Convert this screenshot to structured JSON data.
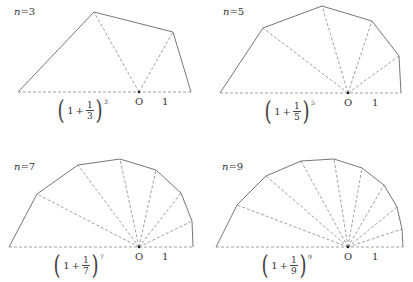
{
  "colors": {
    "line": "#666666",
    "dash": "#888888",
    "text": "#333333"
  },
  "panels": [
    {
      "n": "3",
      "n_prefix": "n",
      "equals": "=",
      "label_pos": [
        14,
        6
      ],
      "origin": [
        139,
        92
      ],
      "left_end": [
        18,
        92
      ],
      "right_end": [
        191,
        92
      ],
      "vertices": [
        [
          18,
          92
        ],
        [
          94,
          12
        ],
        [
          173,
          32
        ],
        [
          191,
          92
        ]
      ],
      "spokes": [
        [
          94,
          12
        ],
        [
          173,
          32
        ]
      ],
      "o_label": "O",
      "o_label_pos": [
        135,
        96
      ],
      "one_label": "1",
      "one_label_pos": [
        162,
        96
      ],
      "formula": {
        "one": "1",
        "plus": "+",
        "num": "1",
        "den": "3",
        "exp": "3"
      },
      "formula_pos": [
        56,
        96
      ]
    },
    {
      "n": "5",
      "n_prefix": "n",
      "equals": "=",
      "label_pos": [
        223,
        6
      ],
      "origin": [
        348,
        93
      ],
      "left_end": [
        220,
        93
      ],
      "right_end": [
        401,
        93
      ],
      "vertices": [
        [
          220,
          93
        ],
        [
          263,
          28
        ],
        [
          322,
          6
        ],
        [
          372,
          21
        ],
        [
          399,
          56
        ],
        [
          401,
          93
        ]
      ],
      "spokes": [
        [
          263,
          28
        ],
        [
          322,
          6
        ],
        [
          372,
          21
        ],
        [
          399,
          56
        ]
      ],
      "o_label": "O",
      "o_label_pos": [
        344,
        97
      ],
      "one_label": "1",
      "one_label_pos": [
        372,
        97
      ],
      "formula": {
        "one": "1",
        "plus": "+",
        "num": "1",
        "den": "5",
        "exp": "5"
      },
      "formula_pos": [
        263,
        97
      ]
    },
    {
      "n": "7",
      "n_prefix": "n",
      "equals": "=",
      "label_pos": [
        14,
        161
      ],
      "origin": [
        139,
        247
      ],
      "left_end": [
        9,
        247
      ],
      "right_end": [
        193,
        247
      ],
      "vertices": [
        [
          9,
          247
        ],
        [
          37,
          194
        ],
        [
          78,
          165
        ],
        [
          120,
          159
        ],
        [
          156,
          170
        ],
        [
          181,
          193
        ],
        [
          192,
          221
        ],
        [
          193,
          247
        ]
      ],
      "spokes": [
        [
          37,
          194
        ],
        [
          78,
          165
        ],
        [
          120,
          159
        ],
        [
          156,
          170
        ],
        [
          181,
          193
        ],
        [
          192,
          221
        ]
      ],
      "o_label": "O",
      "o_label_pos": [
        135,
        251
      ],
      "one_label": "1",
      "one_label_pos": [
        162,
        251
      ],
      "formula": {
        "one": "1",
        "plus": "+",
        "num": "1",
        "den": "7",
        "exp": "7"
      },
      "formula_pos": [
        52,
        251
      ]
    },
    {
      "n": "9",
      "n_prefix": "n",
      "equals": "=",
      "label_pos": [
        222,
        161
      ],
      "origin": [
        348,
        247
      ],
      "left_end": [
        216,
        247
      ],
      "right_end": [
        403,
        247
      ],
      "vertices": [
        [
          216,
          247
        ],
        [
          237,
          205
        ],
        [
          266,
          176
        ],
        [
          301,
          161
        ],
        [
          334,
          159
        ],
        [
          362,
          168
        ],
        [
          384,
          185
        ],
        [
          397,
          207
        ],
        [
          402,
          229
        ],
        [
          403,
          247
        ]
      ],
      "spokes": [
        [
          237,
          205
        ],
        [
          266,
          176
        ],
        [
          301,
          161
        ],
        [
          334,
          159
        ],
        [
          362,
          168
        ],
        [
          384,
          185
        ],
        [
          397,
          207
        ],
        [
          402,
          229
        ]
      ],
      "o_label": "O",
      "o_label_pos": [
        344,
        251
      ],
      "one_label": "1",
      "one_label_pos": [
        372,
        251
      ],
      "formula": {
        "one": "1",
        "plus": "+",
        "num": "1",
        "den": "9",
        "exp": "9"
      },
      "formula_pos": [
        260,
        251
      ]
    }
  ]
}
